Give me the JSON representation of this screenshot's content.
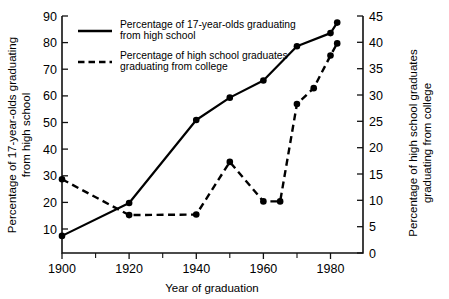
{
  "chart_data": {
    "type": "line",
    "title": "",
    "xlabel": "Year of graduation",
    "ylabel": "Percentage of 17-year-olds graduating from high school",
    "ylabel_right": "Percentage of high school graduates graduating from college",
    "xlim": [
      1895,
      1985
    ],
    "ylim": [
      0,
      90
    ],
    "ylim_right": [
      0,
      45
    ],
    "grid": false,
    "legend_position": "top-left-inside",
    "xticks": [
      1900,
      1920,
      1940,
      1960,
      1980
    ],
    "xticklabels": [
      "1900",
      "1920",
      "1940",
      "1960",
      "1980"
    ],
    "xticks_minor": [
      1910,
      1930,
      1950,
      1970
    ],
    "yticks": [
      10,
      20,
      30,
      40,
      50,
      60,
      70,
      80,
      90
    ],
    "yticklabels": [
      "10",
      "20",
      "30",
      "40",
      "50",
      "60",
      "70",
      "80",
      "90"
    ],
    "yticks_right": [
      0,
      5,
      10,
      15,
      20,
      25,
      30,
      35,
      40,
      45
    ],
    "yticklabels_right": [
      "0",
      "5",
      "10",
      "15",
      "20",
      "25",
      "30",
      "35",
      "40",
      "45"
    ],
    "series": [
      {
        "name": "Percentage of 17-year-olds graduating from high school",
        "axis": "left",
        "style": "solid",
        "marker": "filled-circle",
        "x": [
          1900,
          1920,
          1940,
          1950,
          1960,
          1970,
          1980,
          1982
        ],
        "values": [
          6.5,
          19.0,
          50.5,
          59.0,
          65.5,
          78.5,
          83.5,
          87.5
        ]
      },
      {
        "name": "Percentage of high school graduates graduating from college",
        "axis": "right",
        "style": "dashed",
        "marker": "filled-circle",
        "x": [
          1900,
          1920,
          1940,
          1950,
          1960,
          1965,
          1970,
          1975,
          1980,
          1982
        ],
        "values": [
          14.0,
          7.2,
          7.3,
          17.3,
          9.8,
          9.8,
          28.3,
          31.3,
          37.5,
          39.8
        ]
      }
    ]
  },
  "legend": {
    "entries": [
      {
        "style": "solid",
        "line1": "Percentage of 17-year-olds graduating",
        "line2": "from high school"
      },
      {
        "style": "dashed",
        "line1": "Percentage of high school graduates",
        "line2": "graduating from college"
      }
    ]
  },
  "axes": {
    "x_title": "Year of graduation",
    "y_left_line1": "Percentage of 17-year-olds graduating",
    "y_left_line2": "from high school",
    "y_right_line1": "Percentage of high school graduates",
    "y_right_line2": "graduating from college",
    "x_tick_labels": [
      "1900",
      "1920",
      "1940",
      "1960",
      "1980"
    ],
    "y_left_tick_labels": [
      "90",
      "80",
      "70",
      "60",
      "50",
      "40",
      "30",
      "20",
      "10"
    ],
    "y_right_tick_labels": [
      "45",
      "40",
      "35",
      "30",
      "25",
      "20",
      "15",
      "10",
      "5",
      "0"
    ]
  },
  "colors": {
    "background": "#ffffff",
    "ink": "#000000",
    "axis": "#111111"
  }
}
